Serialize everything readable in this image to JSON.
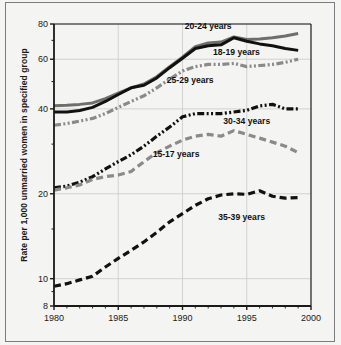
{
  "figure": {
    "outer_border_color": "#7c7c80",
    "background": "#f4f4f2",
    "axis_color": "#1a1a1a",
    "grid_color": "#c9c9c9"
  },
  "axis": {
    "y_title": "Rate per 1,000 unmarried women in specified group",
    "y_ticks": [
      "80",
      "60",
      "40",
      "20",
      "10",
      "8"
    ],
    "x_ticks": [
      "1980",
      "1985",
      "1990",
      "1995",
      "2000"
    ]
  },
  "labels": {
    "l2024": "20-24 years",
    "l1819": "18-19 years",
    "l2529": "25-29 years",
    "l3034": "30-34 years",
    "l1517": "15-17 years",
    "l3539": "35-39 years"
  },
  "chart_data": {
    "type": "line",
    "title": "",
    "xlabel": "",
    "ylabel": "Rate per 1,000 unmarried women in specified group",
    "yscale": "log",
    "ylim": [
      8,
      80
    ],
    "xlim": [
      1980,
      2000
    ],
    "grid": true,
    "legend_position": "inline-annotations",
    "y_ticks": [
      80,
      60,
      40,
      20,
      10,
      8
    ],
    "x_ticks": [
      1980,
      1985,
      1990,
      1995,
      2000
    ],
    "x": [
      1980,
      1981,
      1982,
      1983,
      1984,
      1985,
      1986,
      1987,
      1988,
      1989,
      1990,
      1991,
      1992,
      1993,
      1994,
      1995,
      1996,
      1997,
      1998,
      1999
    ],
    "series": [
      {
        "name": "20-24 years",
        "color": "#6e6e6e",
        "style": "solid",
        "values": [
          41.0,
          41.2,
          41.5,
          42.0,
          43.5,
          45.5,
          47.5,
          49.0,
          52.0,
          56.5,
          61.0,
          66.5,
          68.5,
          69.0,
          72.0,
          70.5,
          70.8,
          71.5,
          72.5,
          74.0
        ]
      },
      {
        "name": "18-19 years",
        "color": "#111111",
        "style": "solid",
        "values": [
          39.0,
          39.0,
          39.5,
          40.5,
          42.5,
          45.0,
          47.5,
          48.5,
          51.5,
          56.0,
          60.5,
          65.5,
          67.0,
          67.5,
          71.5,
          69.5,
          68.0,
          67.0,
          65.5,
          64.5
        ]
      },
      {
        "name": "25-29 years",
        "color": "#8a8a8a",
        "style": "dash-dot-dot",
        "values": [
          35.0,
          35.5,
          36.2,
          37.0,
          38.5,
          40.5,
          42.5,
          44.5,
          47.5,
          51.0,
          54.5,
          56.5,
          57.5,
          57.5,
          58.0,
          56.5,
          57.0,
          57.5,
          58.5,
          60.0
        ]
      },
      {
        "name": "30-34 years",
        "color": "#111111",
        "style": "dash-dot-dot",
        "values": [
          21.0,
          21.3,
          22.0,
          23.0,
          24.5,
          26.0,
          27.5,
          29.5,
          32.0,
          34.5,
          37.5,
          38.5,
          38.5,
          38.5,
          39.0,
          39.5,
          41.0,
          41.5,
          40.0,
          40.0
        ]
      },
      {
        "name": "15-17 years",
        "color": "#8a8a8a",
        "style": "long-dash",
        "values": [
          20.6,
          21.0,
          21.5,
          22.5,
          23.0,
          23.3,
          24.0,
          26.0,
          28.0,
          29.5,
          31.0,
          32.0,
          32.5,
          32.0,
          33.5,
          32.5,
          31.5,
          30.5,
          29.5,
          28.0
        ]
      },
      {
        "name": "35-39 years",
        "color": "#111111",
        "style": "long-dash",
        "values": [
          9.4,
          9.6,
          9.9,
          10.2,
          11.0,
          11.8,
          12.6,
          13.5,
          14.6,
          15.9,
          17.0,
          18.2,
          19.2,
          19.8,
          20.0,
          19.9,
          20.5,
          19.6,
          19.3,
          19.4
        ]
      }
    ],
    "annotations": [
      {
        "text": "20-24 years",
        "x": 1992.0,
        "y": 76.5
      },
      {
        "text": "18-19 years",
        "x": 1994.2,
        "y": 62.0
      },
      {
        "text": "25-29 years",
        "x": 1990.6,
        "y": 49.5
      },
      {
        "text": "30-34 years",
        "x": 1995.0,
        "y": 35.5
      },
      {
        "text": "15-17 years",
        "x": 1989.5,
        "y": 27.0
      },
      {
        "text": "35-39 years",
        "x": 1994.6,
        "y": 16.2
      }
    ]
  }
}
